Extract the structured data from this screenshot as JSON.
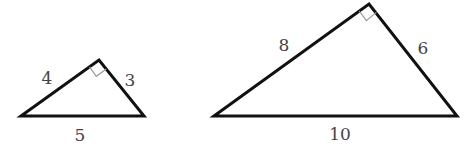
{
  "diagram": {
    "colors": {
      "edge": "#111111",
      "label": "#444444",
      "right_angle_mark": "#9a9a9a",
      "background": "#ffffff"
    },
    "triangles": [
      {
        "name": "small",
        "vertices": {
          "left": [
            21,
            116
          ],
          "apex": [
            99,
            60
          ],
          "right": [
            144,
            116
          ]
        },
        "right_angle_at": "apex",
        "sides": [
          {
            "name": "left-leg",
            "label": "4",
            "pos": [
              47,
              84
            ]
          },
          {
            "name": "right-leg",
            "label": "3",
            "pos": [
              130,
              86
            ]
          },
          {
            "name": "hypotenuse",
            "label": "5",
            "pos": [
              80,
              141
            ]
          }
        ]
      },
      {
        "name": "large",
        "vertices": {
          "left": [
            214,
            116
          ],
          "apex": [
            369,
            4
          ],
          "right": [
            457,
            116
          ]
        },
        "right_angle_at": "apex",
        "sides": [
          {
            "name": "left-leg",
            "label": "8",
            "pos": [
              284,
              51
            ]
          },
          {
            "name": "right-leg",
            "label": "6",
            "pos": [
              423,
              54
            ]
          },
          {
            "name": "hypotenuse",
            "label": "10",
            "pos": [
              340,
              140
            ]
          }
        ]
      }
    ]
  }
}
